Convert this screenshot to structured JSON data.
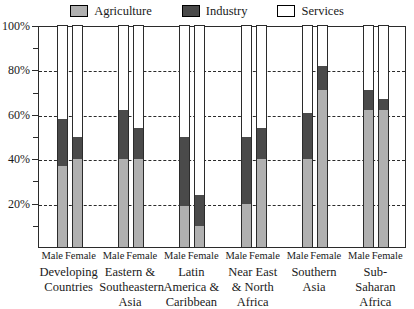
{
  "legend": {
    "items": [
      {
        "label": "Agriculture",
        "key": "agriculture",
        "color": "#b0b0b0"
      },
      {
        "label": "Industry",
        "key": "industry",
        "color": "#4a4a4a"
      },
      {
        "label": "Services",
        "key": "services",
        "color": "#ffffff"
      }
    ]
  },
  "axis": {
    "y_major_labels": [
      "100%",
      "80%",
      "60%",
      "40%",
      "20%"
    ],
    "y_major_values": [
      100,
      80,
      60,
      40,
      20
    ],
    "y_minor_values": [
      90,
      70,
      50,
      30,
      10
    ]
  },
  "sex_labels": {
    "male": "Male",
    "female": "Female"
  },
  "groups": [
    {
      "region": "Developing\nCountries",
      "region_lines": [
        "Developing",
        "Countries"
      ]
    },
    {
      "region": "Eastern &\nSoutheastern\nAsia",
      "region_lines": [
        "Eastern &",
        "Southeastern",
        "Asia"
      ]
    },
    {
      "region": "Latin\nAmerica &\nCaribbean",
      "region_lines": [
        "Latin",
        "America &",
        "Caribbean"
      ]
    },
    {
      "region": "Near East\n& North\nAfrica",
      "region_lines": [
        "Near East",
        "& North",
        "Africa"
      ]
    },
    {
      "region": "Southern\nAsia",
      "region_lines": [
        "Southern",
        "Asia"
      ]
    },
    {
      "region": "Sub-\nSaharan\nAfrica",
      "region_lines": [
        "Sub-",
        "Saharan",
        "Africa"
      ]
    }
  ],
  "chart_data": {
    "type": "bar",
    "subtype": "stacked-100-percent",
    "title": "",
    "xlabel": "",
    "ylabel": "",
    "ylim": [
      0,
      100
    ],
    "grid": true,
    "legend_position": "top-center",
    "categories": [
      "Developing Countries - Male",
      "Developing Countries - Female",
      "Eastern & Southeastern Asia - Male",
      "Eastern & Southeastern Asia - Female",
      "Latin America & Caribbean - Male",
      "Latin America & Caribbean - Female",
      "Near East & North Africa - Male",
      "Near East & North Africa - Female",
      "Southern Asia - Male",
      "Southern Asia - Female",
      "Sub-Saharan Africa - Male",
      "Sub-Saharan Africa - Female"
    ],
    "series": [
      {
        "name": "Agriculture",
        "color": "#b0b0b0",
        "values": [
          37,
          40,
          40,
          40,
          19,
          10,
          20,
          40,
          40,
          71,
          62,
          62
        ]
      },
      {
        "name": "Industry",
        "color": "#4a4a4a",
        "values": [
          21,
          10,
          22,
          14,
          31,
          14,
          30,
          14,
          21,
          11,
          9,
          5
        ]
      },
      {
        "name": "Services",
        "color": "#ffffff",
        "values": [
          42,
          50,
          38,
          46,
          50,
          76,
          50,
          46,
          39,
          18,
          29,
          33
        ]
      }
    ],
    "bars": [
      {
        "group": "Developing Countries",
        "sex": "Male",
        "agriculture": 37,
        "industry": 21,
        "services": 42,
        "agri_top": 37,
        "ind_top": 58
      },
      {
        "group": "Developing Countries",
        "sex": "Female",
        "agriculture": 40,
        "industry": 10,
        "services": 50,
        "agri_top": 40,
        "ind_top": 50
      },
      {
        "group": "Eastern & Southeastern Asia",
        "sex": "Male",
        "agriculture": 40,
        "industry": 22,
        "services": 38,
        "agri_top": 40,
        "ind_top": 62
      },
      {
        "group": "Eastern & Southeastern Asia",
        "sex": "Female",
        "agriculture": 40,
        "industry": 14,
        "services": 46,
        "agri_top": 40,
        "ind_top": 54
      },
      {
        "group": "Latin America & Caribbean",
        "sex": "Male",
        "agriculture": 19,
        "industry": 31,
        "services": 50,
        "agri_top": 19,
        "ind_top": 50
      },
      {
        "group": "Latin America & Caribbean",
        "sex": "Female",
        "agriculture": 10,
        "industry": 14,
        "services": 76,
        "agri_top": 10,
        "ind_top": 24
      },
      {
        "group": "Near East & North Africa",
        "sex": "Male",
        "agriculture": 20,
        "industry": 30,
        "services": 50,
        "agri_top": 20,
        "ind_top": 50
      },
      {
        "group": "Near East & North Africa",
        "sex": "Female",
        "agriculture": 40,
        "industry": 14,
        "services": 46,
        "agri_top": 40,
        "ind_top": 54
      },
      {
        "group": "Southern Asia",
        "sex": "Male",
        "agriculture": 40,
        "industry": 21,
        "services": 39,
        "agri_top": 40,
        "ind_top": 61
      },
      {
        "group": "Southern Asia",
        "sex": "Female",
        "agriculture": 71,
        "industry": 11,
        "services": 18,
        "agri_top": 71,
        "ind_top": 82
      },
      {
        "group": "Sub-Saharan Africa",
        "sex": "Male",
        "agriculture": 62,
        "industry": 9,
        "services": 29,
        "agri_top": 62,
        "ind_top": 71
      },
      {
        "group": "Sub-Saharan Africa",
        "sex": "Female",
        "agriculture": 62,
        "industry": 5,
        "services": 33,
        "agri_top": 62,
        "ind_top": 67
      }
    ]
  }
}
